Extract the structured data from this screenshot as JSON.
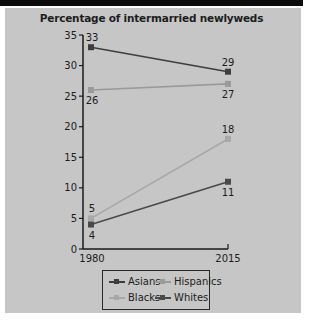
{
  "chart_data": {
    "type": "line",
    "title": "Percentage of intermarried newlyweds",
    "x": [
      1980,
      2015
    ],
    "xlabel": "",
    "ylabel": "",
    "ylim": [
      0,
      35
    ],
    "yticks": [
      0,
      5,
      10,
      15,
      20,
      25,
      30,
      35
    ],
    "xticks": [
      "1980",
      "2015"
    ],
    "grid": false,
    "legend_position": "bottom",
    "series": [
      {
        "name": "Asians",
        "values": [
          33,
          29
        ],
        "color": "#3d3d3d"
      },
      {
        "name": "Hispanics",
        "values": [
          26,
          27
        ],
        "color": "#9a9a9a"
      },
      {
        "name": "Blacks",
        "values": [
          5,
          18
        ],
        "color": "#a8a8a8"
      },
      {
        "name": "Whites",
        "values": [
          4,
          11
        ],
        "color": "#4a4a4a"
      }
    ],
    "data_labels": {
      "Asians": [
        "33",
        "29"
      ],
      "Hispanics": [
        "26",
        "27"
      ],
      "Blacks": [
        "5",
        "18"
      ],
      "Whites": [
        "4",
        "11"
      ]
    }
  },
  "legend": {
    "items": [
      {
        "label": "Asians",
        "color": "#3d3d3d"
      },
      {
        "label": "Hispanics",
        "color": "#9a9a9a"
      },
      {
        "label": "Blacks",
        "color": "#a8a8a8"
      },
      {
        "label": "Whites",
        "color": "#4a4a4a"
      }
    ]
  }
}
